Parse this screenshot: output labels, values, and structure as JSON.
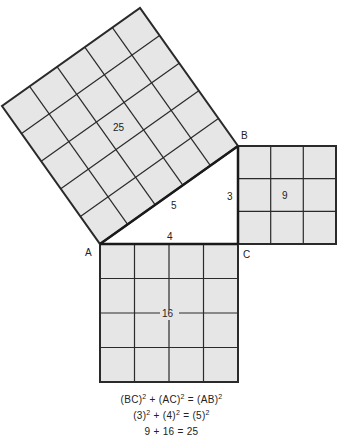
{
  "diagram": {
    "vertices": {
      "A": {
        "label": "A",
        "x": 100,
        "y": 244
      },
      "B": {
        "label": "B",
        "x": 238,
        "y": 146
      },
      "C": {
        "label": "C",
        "x": 238,
        "y": 244
      }
    },
    "sides": {
      "BC": {
        "label": "3"
      },
      "AC": {
        "label": "4"
      },
      "AB": {
        "label": "5"
      }
    },
    "squares": {
      "hypotenuse": {
        "area_label": "25",
        "grid": 5
      },
      "vertical_leg": {
        "area_label": "9",
        "grid": 3
      },
      "horizontal_leg": {
        "area_label": "16",
        "grid": 4
      }
    },
    "colors": {
      "fill": "#e6e6e6",
      "stroke": "#2a2a2a",
      "background": "#ffffff"
    }
  },
  "equations": {
    "line1": {
      "t1": "(BC)",
      "e1": "2",
      "op1": " + ",
      "t2": "(AC)",
      "e2": "2",
      "op2": " = ",
      "t3": "(AB)",
      "e3": "2"
    },
    "line2": {
      "t1": "(3)",
      "e1": "2",
      "op1": " + ",
      "t2": "(4)",
      "e2": "2",
      "op2": " = ",
      "t3": "(5)",
      "e3": "2"
    },
    "line3": {
      "text": "9 + 16 = 25"
    }
  }
}
